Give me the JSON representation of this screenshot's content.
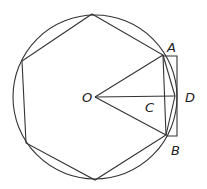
{
  "diagram": {
    "title": "",
    "labels": {
      "A": "A",
      "B": "B",
      "C": "C",
      "D": "D",
      "O": "O"
    },
    "stroke_color": "#333333",
    "background": "#ffffff"
  }
}
